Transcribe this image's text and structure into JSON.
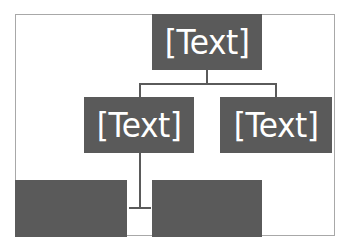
{
  "diagram": {
    "type": "org-chart",
    "nodes": [
      {
        "id": "root",
        "label": "[Text]",
        "level": 0
      },
      {
        "id": "child-left",
        "label": "[Text]",
        "level": 1,
        "parent": "root"
      },
      {
        "id": "child-right",
        "label": "[Text]",
        "level": 1,
        "parent": "root"
      },
      {
        "id": "grandchild-left",
        "label": "",
        "level": 2,
        "parent": "child-left"
      },
      {
        "id": "grandchild-right",
        "label": "",
        "level": 2,
        "parent": "child-left"
      }
    ],
    "colors": {
      "node_fill": "#5a5a5a",
      "node_text": "#ffffff",
      "connector": "#5a5a5a",
      "frame_border": "#a8a8a8"
    }
  }
}
